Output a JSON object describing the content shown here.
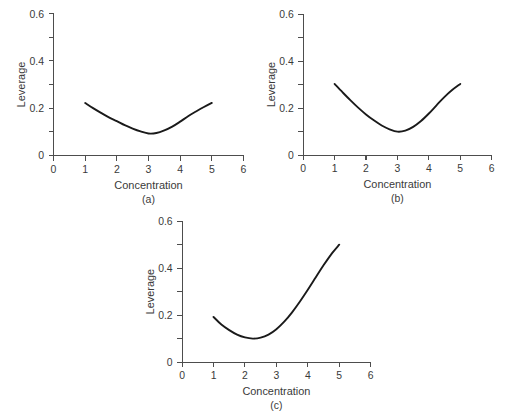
{
  "figure": {
    "background": "#ffffff",
    "curve_color": "#1a1a1a",
    "axis_color": "#4d4d4d",
    "text_color": "#3a3a3a"
  },
  "panels": {
    "a": {
      "caption": "(a)",
      "xlabel": "Concentration",
      "ylabel": "Leverage"
    },
    "b": {
      "caption": "(b)",
      "xlabel": "Concentration",
      "ylabel": "Leverage"
    },
    "c": {
      "caption": "(c)",
      "xlabel": "Concentration",
      "ylabel": "Leverage"
    }
  },
  "axis_labels": {
    "x_ticks": [
      "0",
      "1",
      "2",
      "3",
      "4",
      "5",
      "6"
    ],
    "y_ticks": [
      "0",
      "0.2",
      "0.4",
      "0.6"
    ]
  },
  "chart_data": [
    {
      "id": "a",
      "type": "line",
      "title": "(a)",
      "xlabel": "Concentration",
      "ylabel": "Leverage",
      "xlim": [
        0,
        6
      ],
      "ylim": [
        0,
        0.6
      ],
      "xticks": [
        0,
        1,
        2,
        3,
        4,
        5,
        6
      ],
      "xticklabels": [
        "0",
        "1",
        "2",
        "3",
        "4",
        "5",
        "6"
      ],
      "yticks": [
        0,
        0.1,
        0.2,
        0.3,
        0.4,
        0.5,
        0.6
      ],
      "yticklabels": [
        "0",
        "",
        "0.2",
        "",
        "0.4",
        "",
        "0.6"
      ],
      "grid": false,
      "legend": "none",
      "description": "Symmetric U-shaped leverage curve, minimum at concentration 3",
      "series": [
        {
          "name": "leverage",
          "x": [
            1.0,
            1.25,
            1.5,
            1.75,
            2.0,
            2.25,
            2.5,
            2.75,
            3.0,
            3.25,
            3.5,
            3.75,
            4.0,
            4.25,
            4.5,
            4.75,
            5.0
          ],
          "y": [
            0.222,
            0.2,
            0.18,
            0.161,
            0.145,
            0.128,
            0.114,
            0.102,
            0.093,
            0.095,
            0.106,
            0.122,
            0.143,
            0.166,
            0.186,
            0.205,
            0.222
          ]
        }
      ]
    },
    {
      "id": "b",
      "type": "line",
      "title": "(b)",
      "xlabel": "Concentration",
      "ylabel": "Leverage",
      "xlim": [
        0,
        6
      ],
      "ylim": [
        0,
        0.6
      ],
      "xticks": [
        0,
        1,
        2,
        3,
        4,
        5,
        6
      ],
      "xticklabels": [
        "0",
        "1",
        "2",
        "3",
        "4",
        "5",
        "6"
      ],
      "yticks": [
        0,
        0.1,
        0.2,
        0.3,
        0.4,
        0.5,
        0.6
      ],
      "yticklabels": [
        "0",
        "",
        "0.2",
        "",
        "0.4",
        "",
        "0.6"
      ],
      "grid": false,
      "legend": "none",
      "description": "Symmetric U-shaped leverage curve with higher endpoints, minimum at concentration 3",
      "series": [
        {
          "name": "leverage",
          "x": [
            1.0,
            1.25,
            1.5,
            1.75,
            2.0,
            2.25,
            2.5,
            2.75,
            3.0,
            3.25,
            3.5,
            3.75,
            4.0,
            4.25,
            4.5,
            4.75,
            5.0
          ],
          "y": [
            0.303,
            0.268,
            0.234,
            0.202,
            0.173,
            0.148,
            0.126,
            0.11,
            0.1,
            0.104,
            0.12,
            0.145,
            0.177,
            0.213,
            0.248,
            0.278,
            0.303
          ]
        }
      ]
    },
    {
      "id": "c",
      "type": "line",
      "title": "(c)",
      "xlabel": "Concentration",
      "ylabel": "Leverage",
      "xlim": [
        0,
        6
      ],
      "ylim": [
        0,
        0.6
      ],
      "xticks": [
        0,
        1,
        2,
        3,
        4,
        5,
        6
      ],
      "xticklabels": [
        "0",
        "1",
        "2",
        "3",
        "4",
        "5",
        "6"
      ],
      "yticks": [
        0,
        0.1,
        0.2,
        0.3,
        0.4,
        0.5,
        0.6
      ],
      "yticklabels": [
        "0",
        "",
        "0.2",
        "",
        "0.4",
        "",
        "0.6"
      ],
      "grid": false,
      "legend": "none",
      "description": "Asymmetric leverage curve, minimum near concentration 2.2, rising steeply to 0.50 at concentration 5",
      "series": [
        {
          "name": "leverage",
          "x": [
            1.0,
            1.25,
            1.5,
            1.75,
            2.0,
            2.25,
            2.5,
            2.75,
            3.0,
            3.25,
            3.5,
            3.75,
            4.0,
            4.25,
            4.5,
            4.75,
            5.0
          ],
          "y": [
            0.192,
            0.16,
            0.136,
            0.117,
            0.105,
            0.1,
            0.104,
            0.117,
            0.14,
            0.172,
            0.212,
            0.258,
            0.308,
            0.36,
            0.412,
            0.46,
            0.5
          ]
        }
      ]
    }
  ]
}
